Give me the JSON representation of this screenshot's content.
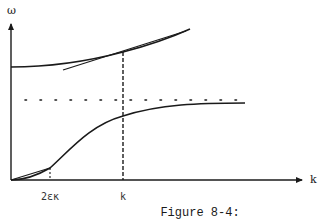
{
  "figure": {
    "caption": "Figure 8-4:",
    "y_axis_label": "ω",
    "x_axis_label": "k",
    "tick_labels": {
      "small_k": "2εκ",
      "k": "k"
    },
    "colors": {
      "ink": "#1a1a1a",
      "background": "#ffffff"
    },
    "elements": [
      "upper curve (optical-like branch) with tangent line at k",
      "horizontal dotted asymptote",
      "lower curve (acoustic-like branch) saturating toward asymptote",
      "vertical dashed line at k",
      "short vertical dashed line at 2εκ with chord from origin"
    ]
  }
}
